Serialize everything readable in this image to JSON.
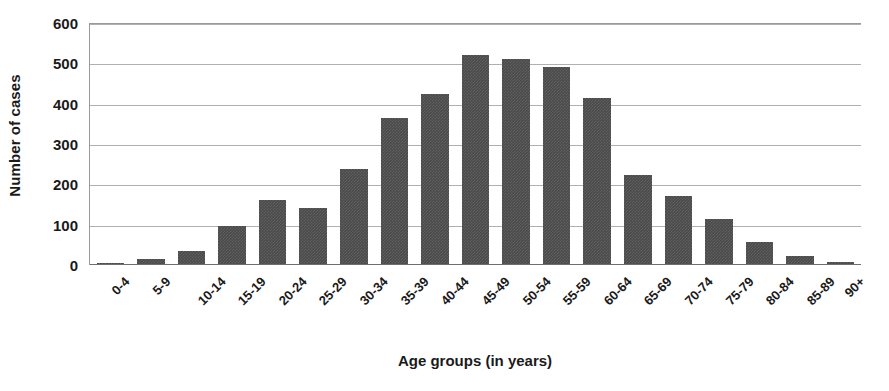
{
  "chart_data": {
    "type": "bar",
    "title": "",
    "xlabel": "Age groups (in years)",
    "ylabel": "Number of cases",
    "categories": [
      "0-4",
      "5-9",
      "10-14",
      "15-19",
      "20-24",
      "25-29",
      "30-34",
      "35-39",
      "40-44",
      "45-49",
      "50-54",
      "55-59",
      "60-64",
      "65-69",
      "70-74",
      "75-79",
      "80-84",
      "85-89",
      "90+"
    ],
    "values": [
      6,
      15,
      35,
      97,
      160,
      141,
      237,
      365,
      425,
      520,
      510,
      492,
      415,
      223,
      172,
      113,
      58,
      23,
      7
    ],
    "ylim": [
      0,
      600
    ],
    "yticks": [
      0,
      100,
      200,
      300,
      400,
      500,
      600
    ],
    "ytick_labels": [
      "0",
      "100",
      "200",
      "300",
      "400",
      "500",
      "600"
    ],
    "grid": true,
    "legend": false,
    "legend_position": "none",
    "bar_color": "#4a4a4a",
    "gridline_color": "#b0b0b0",
    "axis_color": "#6e6e6e",
    "background_color": "#ffffff"
  }
}
